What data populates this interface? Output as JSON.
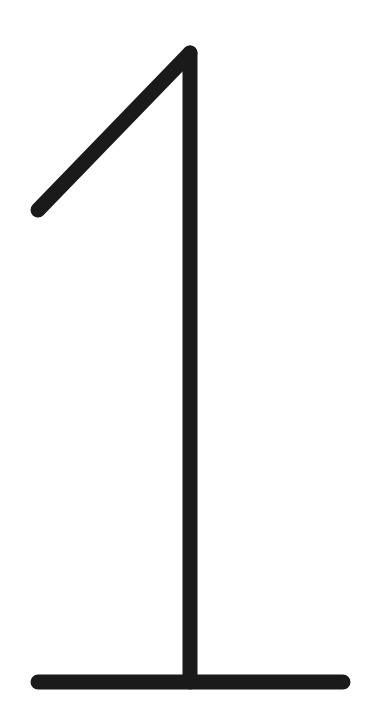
{
  "figure": {
    "label": "1",
    "stroke_color": "#1a1a1a",
    "background_color": "#ffffff",
    "stroke_width": 15,
    "strokes": {
      "flag": {
        "x1": 38,
        "y1": 210,
        "x2": 190,
        "y2": 53
      },
      "stem": {
        "x1": 190,
        "y1": 53,
        "x2": 190,
        "y2": 682
      },
      "base": {
        "x1": 38,
        "y1": 682,
        "x2": 343,
        "y2": 682
      }
    }
  }
}
